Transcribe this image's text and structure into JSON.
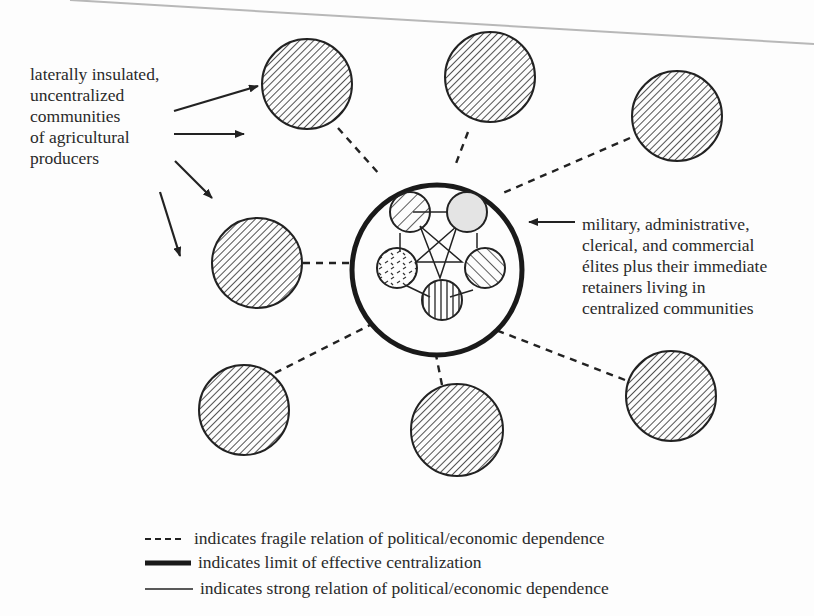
{
  "diagram": {
    "type": "centralization-model",
    "peripheral_communities_count": 8,
    "central_elite_groups_count": 5
  },
  "labels": {
    "left": {
      "lines": [
        "laterally insulated,",
        "uncentralized",
        "communities",
        "of agricultural",
        "producers"
      ]
    },
    "right": {
      "lines": [
        "military, administrative,",
        "clerical, and commercial",
        "élites plus their immediate",
        "retainers living in",
        "centralized communities"
      ]
    }
  },
  "legend": [
    {
      "style": "dashed",
      "text": "indicates fragile relation of political/economic dependence"
    },
    {
      "style": "thick",
      "text": "indicates limit of effective centralization"
    },
    {
      "style": "thin",
      "text": "indicates strong relation of political/economic dependence"
    }
  ],
  "colors": {
    "ink": "#222222",
    "paper": "#fdfdfd",
    "page_edge": "#b8b8b8"
  }
}
